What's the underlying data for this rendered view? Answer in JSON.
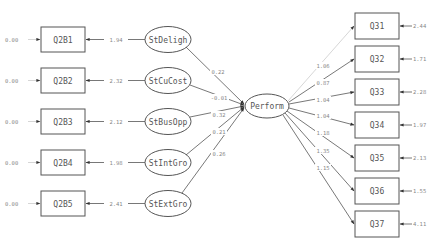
{
  "diagram": {
    "type": "structural-equation-path-diagram",
    "left_observed": [
      {
        "id": "Q2B1",
        "error_variance": "0.00",
        "loading": "1.94",
        "latent": "StDeligh",
        "path_to_perform": "0.22"
      },
      {
        "id": "Q2B2",
        "error_variance": "0.00",
        "loading": "2.32",
        "latent": "StCuCost",
        "path_to_perform": "-0.01"
      },
      {
        "id": "Q2B3",
        "error_variance": "0.00",
        "loading": "2.12",
        "latent": "StBusOpp",
        "path_to_perform": "0.32"
      },
      {
        "id": "Q2B4",
        "error_variance": "0.00",
        "loading": "1.98",
        "latent": "StIntGro",
        "path_to_perform": "0.21"
      },
      {
        "id": "Q2B5",
        "error_variance": "0.00",
        "loading": "2.41",
        "latent": "StExtGro",
        "path_to_perform": "0.26"
      }
    ],
    "central_latent": "Perform",
    "right_observed": [
      {
        "id": "Q31",
        "loading": "1.06",
        "error_variance": "2.44"
      },
      {
        "id": "Q32",
        "loading": "0.87",
        "error_variance": "1.71"
      },
      {
        "id": "Q33",
        "loading": "1.04",
        "error_variance": "2.28"
      },
      {
        "id": "Q34",
        "loading": "1.04",
        "error_variance": "1.97"
      },
      {
        "id": "Q35",
        "loading": "1.18",
        "error_variance": "2.13"
      },
      {
        "id": "Q36",
        "loading": "1.35",
        "error_variance": "1.55"
      },
      {
        "id": "Q37",
        "loading": "1.15",
        "error_variance": "4.11"
      }
    ]
  }
}
